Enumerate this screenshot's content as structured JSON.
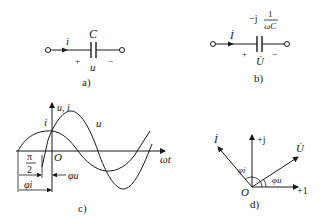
{
  "panel_a": {
    "caption": "a)",
    "capacitor_label": "C",
    "current_label": "i",
    "voltage_label": "u",
    "plus": "+",
    "minus": "−"
  },
  "panel_b": {
    "caption": "b)",
    "impedance_prefix": "−j",
    "impedance_num": "1",
    "impedance_den": "ωC",
    "current_label": "İ",
    "voltage_label": "U̇",
    "plus": "+",
    "minus": "−"
  },
  "panel_c": {
    "caption": "c)",
    "y_axis_label": "u, i",
    "x_axis_label": "ωt",
    "origin_label": "O",
    "curve_i_label": "i",
    "curve_u_label": "u",
    "pi_half_num": "π",
    "pi_half_den": "2",
    "phi_i_label": "φi",
    "phi_u_label": "φu"
  },
  "panel_d": {
    "caption": "d)",
    "real_axis_label": "+1",
    "imag_axis_label": "+j",
    "origin_label": "O",
    "phasor_i_label": "İ",
    "phasor_u_label": "U̇",
    "phi_i_label": "φi",
    "phi_u_label": "φu"
  }
}
